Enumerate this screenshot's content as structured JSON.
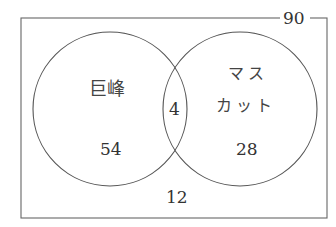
{
  "diagram": {
    "type": "venn",
    "universe_total": "90",
    "set_a": {
      "label": "巨峰",
      "only_count": "54"
    },
    "set_b": {
      "label_line1": "マス",
      "label_line2": "カット",
      "only_count": "28"
    },
    "intersection": "4",
    "outside": "12"
  },
  "colors": {
    "line": "#555555",
    "text": "#333333",
    "background": "#ffffff"
  }
}
